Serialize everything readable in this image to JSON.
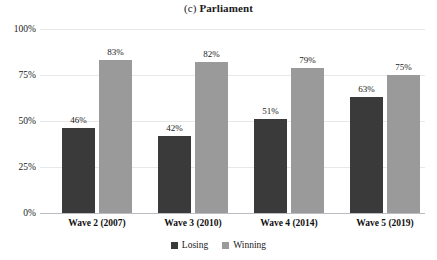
{
  "chart_data": {
    "type": "bar",
    "title": "(c) Parliament",
    "title_prefix": "(c)",
    "title_main": "Parliament",
    "xlabel": "",
    "ylabel": "",
    "ylim": [
      0,
      100
    ],
    "grid": true,
    "legend_position": "bottom-center",
    "categories": [
      "Wave 2 (2007)",
      "Wave 3 (2010)",
      "Wave 4 (2014)",
      "Wave 5 (2019)"
    ],
    "ytick_labels": [
      "100%",
      "75%",
      "50%",
      "25%",
      "0%"
    ],
    "ytick_values": [
      100,
      75,
      50,
      25,
      0
    ],
    "series": [
      {
        "name": "Losing",
        "color": "#3a3a3a",
        "values": [
          46,
          42,
          51,
          63
        ],
        "labels": [
          "46%",
          "42%",
          "51%",
          "63%"
        ]
      },
      {
        "name": "Winning",
        "color": "#9a9a9a",
        "values": [
          83,
          82,
          79,
          75
        ],
        "labels": [
          "83%",
          "82%",
          "79%",
          "75%"
        ]
      }
    ]
  },
  "legend": {
    "items": [
      {
        "label": "Losing",
        "color": "#3a3a3a"
      },
      {
        "label": "Winning",
        "color": "#9a9a9a"
      }
    ]
  }
}
